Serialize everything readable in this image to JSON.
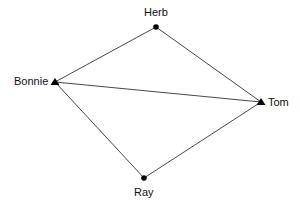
{
  "diagram": {
    "type": "network-graph",
    "nodes": [
      {
        "id": "herb",
        "label": "Herb",
        "shape": "circle",
        "x": 156,
        "y": 27
      },
      {
        "id": "bonnie",
        "label": "Bonnie",
        "shape": "triangle",
        "x": 55,
        "y": 82
      },
      {
        "id": "tom",
        "label": "Tom",
        "shape": "triangle",
        "x": 261,
        "y": 102
      },
      {
        "id": "ray",
        "label": "Ray",
        "shape": "circle",
        "x": 144,
        "y": 178
      }
    ],
    "edges": [
      {
        "from": "herb",
        "to": "bonnie"
      },
      {
        "from": "herb",
        "to": "tom"
      },
      {
        "from": "bonnie",
        "to": "tom"
      },
      {
        "from": "bonnie",
        "to": "ray"
      },
      {
        "from": "tom",
        "to": "ray"
      }
    ]
  }
}
